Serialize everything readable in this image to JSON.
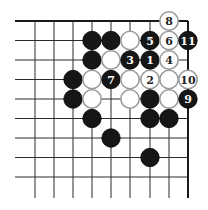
{
  "board": {
    "columns_x": [
      35,
      54,
      73,
      92,
      111,
      130,
      150,
      169,
      188
    ],
    "rows_y": [
      21,
      40.5,
      60,
      79.5,
      99,
      118.5,
      138,
      157.5,
      177
    ],
    "horizontal_line_start_x": 15,
    "vertical_line_end_y": 198,
    "top_edge": true,
    "right_edge": true,
    "stone_radius": 9.2
  },
  "stones": [
    {
      "col": 7,
      "row": 0,
      "color": "white",
      "label": "8"
    },
    {
      "col": 3,
      "row": 1,
      "color": "black",
      "label": ""
    },
    {
      "col": 4,
      "row": 1,
      "color": "black",
      "label": ""
    },
    {
      "col": 5,
      "row": 1,
      "color": "white",
      "label": ""
    },
    {
      "col": 6,
      "row": 1,
      "color": "black",
      "label": "5"
    },
    {
      "col": 7,
      "row": 1,
      "color": "white",
      "label": "6"
    },
    {
      "col": 8,
      "row": 1,
      "color": "black",
      "label": "11"
    },
    {
      "col": 3,
      "row": 2,
      "color": "black",
      "label": ""
    },
    {
      "col": 4,
      "row": 2,
      "color": "white",
      "label": ""
    },
    {
      "col": 5,
      "row": 2,
      "color": "black",
      "label": "3"
    },
    {
      "col": 6,
      "row": 2,
      "color": "black",
      "label": "1"
    },
    {
      "col": 7,
      "row": 2,
      "color": "white",
      "label": "4"
    },
    {
      "col": 2,
      "row": 3,
      "color": "black",
      "label": ""
    },
    {
      "col": 3,
      "row": 3,
      "color": "white",
      "label": ""
    },
    {
      "col": 4,
      "row": 3,
      "color": "black",
      "label": "7"
    },
    {
      "col": 5,
      "row": 3,
      "color": "white",
      "label": ""
    },
    {
      "col": 6,
      "row": 3,
      "color": "white",
      "label": "2"
    },
    {
      "col": 7,
      "row": 3,
      "color": "white",
      "label": ""
    },
    {
      "col": 8,
      "row": 3,
      "color": "white",
      "label": "10"
    },
    {
      "col": 2,
      "row": 4,
      "color": "black",
      "label": ""
    },
    {
      "col": 3,
      "row": 4,
      "color": "white",
      "label": ""
    },
    {
      "col": 5,
      "row": 4,
      "color": "white",
      "label": ""
    },
    {
      "col": 6,
      "row": 4,
      "color": "black",
      "label": ""
    },
    {
      "col": 7,
      "row": 4,
      "color": "white",
      "label": ""
    },
    {
      "col": 8,
      "row": 4,
      "color": "black",
      "label": "9"
    },
    {
      "col": 3,
      "row": 5,
      "color": "black",
      "label": ""
    },
    {
      "col": 6,
      "row": 5,
      "color": "black",
      "label": ""
    },
    {
      "col": 7,
      "row": 5,
      "color": "black",
      "label": ""
    },
    {
      "col": 4,
      "row": 6,
      "color": "black",
      "label": ""
    },
    {
      "col": 6,
      "row": 7,
      "color": "black",
      "label": ""
    }
  ]
}
